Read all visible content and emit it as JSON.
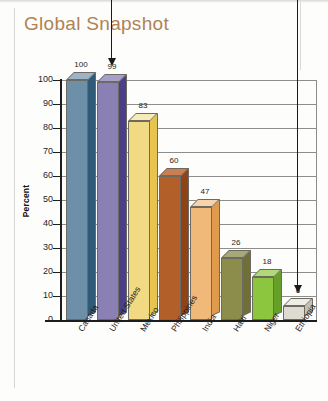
{
  "page": {
    "title": "Global Snapshot"
  },
  "chart_data": {
    "type": "bar",
    "title": "Global Snapshot",
    "xlabel": "",
    "ylabel": "Percent",
    "ylim": [
      0,
      100
    ],
    "ytick_labels": [
      "100",
      "90",
      "80",
      "70",
      "60",
      "50",
      "40",
      "30",
      "20",
      "10",
      "0"
    ],
    "ytick_values": [
      100,
      90,
      80,
      70,
      60,
      50,
      40,
      30,
      20,
      10,
      0
    ],
    "grid": true,
    "legend": "none",
    "categories": [
      "Canada",
      "United States",
      "Mexico",
      "Philippines",
      "India",
      "Haiti",
      "Niger",
      "Ethiopia"
    ],
    "values": [
      100,
      99,
      83,
      60,
      47,
      26,
      18,
      6
    ],
    "value_labels": [
      "100",
      "99",
      "83",
      "60",
      "47",
      "26",
      "18",
      "6"
    ],
    "bar_colors": [
      "#6e8fa8",
      "#8a80b4",
      "#f2d983",
      "#b35f2a",
      "#f0b97a",
      "#8c8d4b",
      "#8cc63f",
      "#dedcd2"
    ],
    "bar_side_colors": [
      "#2f5a78",
      "#4b3f89",
      "#e6c44e",
      "#8e4418",
      "#e09a4c",
      "#6f7036",
      "#66a02a",
      "#c3c1b5"
    ],
    "bar_top_colors": [
      "#9db4c6",
      "#a79ec9",
      "#f7ebb8",
      "#c97f52",
      "#f6d3ab",
      "#a8a877",
      "#b2d977",
      "#eeece4"
    ],
    "annotations": [
      {
        "name": "arrow-united-states",
        "target": "United States",
        "direction": "down"
      },
      {
        "name": "arrow-ethiopia",
        "target": "Ethiopia",
        "direction": "down"
      }
    ]
  },
  "colors": {
    "title": "#b08254",
    "axis": "#1d1d1d",
    "grid": "#8d8d8d",
    "background": "#fdfdfc"
  }
}
